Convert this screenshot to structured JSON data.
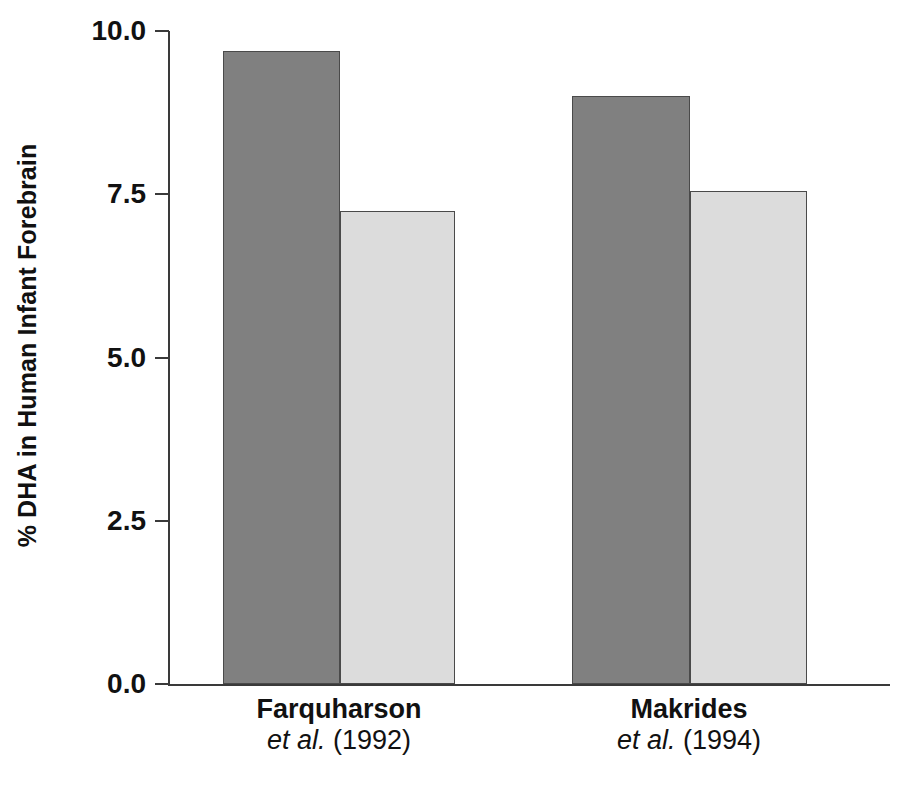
{
  "chart_data": {
    "type": "bar",
    "title": "",
    "xlabel": "",
    "ylabel": "% DHA in Human Infant Forebrain",
    "ylim": [
      0.0,
      10.0
    ],
    "ytick_labels": [
      "10.0",
      "7.5",
      "5.0",
      "2.5",
      "0.0"
    ],
    "ytick_values": [
      10.0,
      7.5,
      5.0,
      2.5,
      0.0
    ],
    "grid": false,
    "legend": "none",
    "categories": [
      "Farquharson et al. (1992)",
      "Makrides et al. (1994)"
    ],
    "category_labels": [
      {
        "name": "Farquharson",
        "citation": "et al. (1992)"
      },
      {
        "name": "Makrides",
        "citation": "et al. (1994)"
      }
    ],
    "series": [
      {
        "name": "dark-bar",
        "color": "#808080",
        "values": [
          9.7,
          9.0
        ]
      },
      {
        "name": "light-bar",
        "color": "#dcdcdc",
        "values": [
          7.25,
          7.55
        ]
      }
    ],
    "bars": [
      {
        "id": "farquharson-dark",
        "group": "Farquharson et al. (1992)",
        "series": "dark-bar",
        "value": 9.7,
        "color": "#808080"
      },
      {
        "id": "farquharson-light",
        "group": "Farquharson et al. (1992)",
        "series": "light-bar",
        "value": 7.25,
        "color": "#dcdcdc"
      },
      {
        "id": "makrides-dark",
        "group": "Makrides et al. (1994)",
        "series": "dark-bar",
        "value": 9.0,
        "color": "#808080"
      },
      {
        "id": "makrides-light",
        "group": "Makrides et al. (1994)",
        "series": "light-bar",
        "value": 7.55,
        "color": "#dcdcdc"
      }
    ]
  },
  "axis": {
    "y_title": "% DHA in Human Infant Forebrain",
    "ticks": [
      {
        "label": "10.0",
        "value": 10.0
      },
      {
        "label": "7.5",
        "value": 7.5
      },
      {
        "label": "5.0",
        "value": 5.0
      },
      {
        "label": "2.5",
        "value": 2.5
      },
      {
        "label": "0.0",
        "value": 0.0
      }
    ]
  },
  "colors": {
    "dark_bar": "#808080",
    "light_bar": "#dcdcdc",
    "bar_outline": "#4a4a4a",
    "axis": "#3a3a3a",
    "text": "#111111",
    "background": "#ffffff"
  }
}
